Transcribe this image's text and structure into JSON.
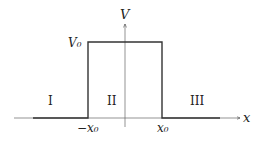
{
  "diagram": {
    "axes": {
      "x_label": "x",
      "y_label": "V"
    },
    "levels": {
      "barrier_height": "V₀"
    },
    "ticks": {
      "left": "−x₀",
      "right": "x₀"
    },
    "regions": [
      {
        "label": "I"
      },
      {
        "label": "II"
      },
      {
        "label": "III"
      }
    ]
  }
}
